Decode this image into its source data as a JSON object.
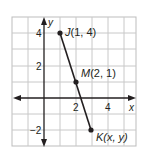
{
  "figure": {
    "type": "coordinate-plane",
    "axes": {
      "x_label": "x",
      "y_label": "y",
      "x_ticks": [
        {
          "value": 2,
          "label": "2"
        },
        {
          "value": 4,
          "label": "4"
        }
      ],
      "y_ticks": [
        {
          "value": 4,
          "label": "4"
        },
        {
          "value": 2,
          "label": "2"
        },
        {
          "value": -2,
          "label": "−2"
        }
      ]
    },
    "grid": {
      "x_min": -2,
      "x_max": 5.75,
      "y_min": -3,
      "y_max": 5,
      "step": 1
    },
    "segment": {
      "from": "J",
      "to": "K",
      "color": "#231f20"
    },
    "points": [
      {
        "id": "J",
        "name": "J",
        "coords": "(1, 4)",
        "x": 1,
        "y": 4
      },
      {
        "id": "M",
        "name": "M",
        "coords": "(2, 1)",
        "x": 2,
        "y": 1
      },
      {
        "id": "K",
        "name": "K",
        "coords": "(x, y)",
        "x": 3,
        "y": -2
      }
    ],
    "colors": {
      "grid": "#c8c8c8",
      "axis": "#231f20",
      "border": "#bdbdbd",
      "background": "#ffffff"
    }
  }
}
